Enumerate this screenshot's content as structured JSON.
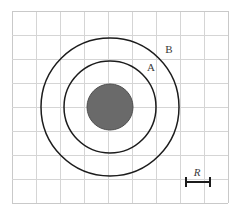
{
  "figure": {
    "background_color": "#ffffff",
    "width": 241,
    "height": 220
  },
  "grid": {
    "line_color": "#d5d5d5",
    "outer_line_color": "#c9c9c9",
    "cell_size": 24,
    "origin_x": 12,
    "origin_y": 11,
    "columns": 9,
    "rows": 8,
    "right_edge": 228,
    "bottom_edge": 203
  },
  "labels": {
    "circle_a": "A",
    "circle_b": "B",
    "scale": "R"
  },
  "chart_data": {
    "type": "diagram",
    "units": "R",
    "center": {
      "x": 110,
      "y": 107
    },
    "shapes": [
      {
        "name": "core-disk",
        "kind": "filled-circle",
        "label": "",
        "radius_px": 23,
        "radius_in_R": 1,
        "fill": "#6a6a6a",
        "stroke": "#4e4e4e"
      },
      {
        "name": "circle-a",
        "kind": "outline-circle",
        "label": "A",
        "radius_px": 46,
        "radius_in_R": 2,
        "fill": "none",
        "stroke": "#1c1c1c"
      },
      {
        "name": "circle-b",
        "kind": "outline-circle",
        "label": "B",
        "radius_px": 69,
        "radius_in_R": 3,
        "fill": "none",
        "stroke": "#1c1c1c"
      }
    ],
    "scale_bar": {
      "label": "R",
      "length_px": 24,
      "length_in_grid_cells": 1,
      "x_start": 186,
      "x_end": 210,
      "y": 182,
      "label_x": 197,
      "label_y": 176
    },
    "label_positions": [
      {
        "text": "A",
        "x": 151,
        "y": 71
      },
      {
        "text": "B",
        "x": 169,
        "y": 53
      }
    ]
  }
}
